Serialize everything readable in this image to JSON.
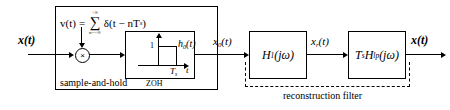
{
  "diagram": {
    "input_signal": "x(t)",
    "output_signal": "x(t)",
    "signals": {
      "input": "x(t)",
      "after_zoh": "x",
      "after_zoh_sub": "0",
      "after_zoh_tail": "(t)",
      "after_h1": "x",
      "after_h1_sub": "r",
      "after_h1_tail": "(t)",
      "output": "x(t)"
    },
    "impulse_train": {
      "lhs": "v(t)",
      "equals": "=",
      "upper_limit": "+∞",
      "sigma": "∑",
      "lower_limit": "n=−∞",
      "term": "δ(t − nT",
      "term_sub": "s",
      "term_close": ")"
    },
    "multiplier": {
      "symbol": "×"
    },
    "zoh": {
      "impulse_response": "h",
      "impulse_response_sub": "0",
      "impulse_response_tail": "(t)",
      "amplitude_tick": "1",
      "time_tick": "T",
      "time_tick_sub": "s",
      "time_axis": "t",
      "caption": "ZOH"
    },
    "groups": {
      "sample_and_hold": "sample-and-hold",
      "reconstruction_filter": "reconstruction filter"
    },
    "blocks": [
      {
        "name": "h1-filter",
        "label": "H",
        "sub": "1",
        "tail": "(jω)"
      },
      {
        "name": "lowpass-filter",
        "label": "T",
        "sub": "s",
        "mid": "H",
        "sub2": "lp",
        "tail": "(jω)"
      }
    ],
    "colors": {
      "line": "#000000",
      "background": "#ffffff"
    }
  }
}
